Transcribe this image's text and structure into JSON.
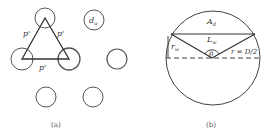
{
  "figure": {
    "panel_a": {
      "caption": "(a)",
      "pitch_label": "p'",
      "diameter_label": "d",
      "diameter_subscript": "o",
      "circles": [
        {
          "cx": 45,
          "cy": 18,
          "r": 10
        },
        {
          "cx": 94,
          "cy": 20,
          "r": 10
        },
        {
          "cx": 22,
          "cy": 59,
          "r": 11
        },
        {
          "cx": 69,
          "cy": 59,
          "r": 11
        },
        {
          "cx": 117,
          "cy": 59,
          "r": 10
        },
        {
          "cx": 46,
          "cy": 97,
          "r": 10
        },
        {
          "cx": 93,
          "cy": 97,
          "r": 10
        }
      ],
      "triangle": [
        [
          45,
          18
        ],
        [
          22,
          59
        ],
        [
          69,
          59
        ]
      ]
    },
    "panel_b": {
      "caption": "(b)",
      "area_label": "A",
      "area_subscript": "d",
      "chord_label": "L",
      "chord_subscript": "w",
      "height_label": "r",
      "height_subscript": "w",
      "angle_label": "θ",
      "radius_label": "r = D/2",
      "circle": {
        "cx": 213,
        "cy": 58,
        "r": 47
      }
    }
  }
}
